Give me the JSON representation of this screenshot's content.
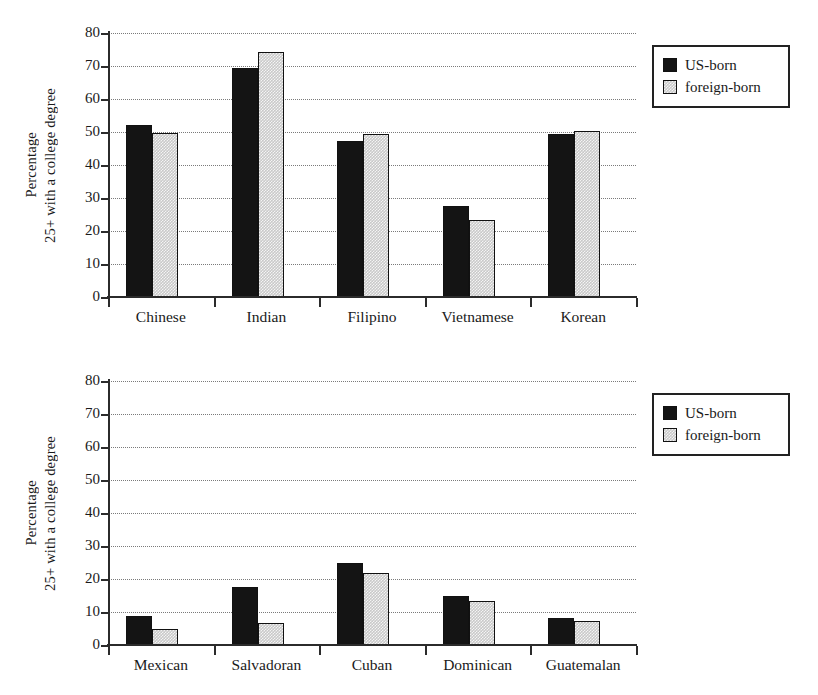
{
  "chart_data": [
    {
      "type": "bar",
      "id": "asian-origin-groups",
      "title": "",
      "xlabel": "",
      "ylabel": "Percentage 25+ with a college degree",
      "ylabel_lines": [
        "Percentage",
        "25+ with a college degree"
      ],
      "ylim": [
        0,
        80
      ],
      "yticks": [
        0,
        10,
        20,
        30,
        40,
        50,
        60,
        70,
        80
      ],
      "grid": true,
      "grid_style": "dotted-horizontal",
      "legend_position": "right",
      "categories": [
        "Chinese",
        "Indian",
        "Filipino",
        "Vietnamese",
        "Korean"
      ],
      "series": [
        {
          "name": "US-born",
          "color": "#141414",
          "values": [
            52.0,
            69.5,
            47.3,
            27.5,
            49.5
          ]
        },
        {
          "name": "foreign-born",
          "color": "#c9c9c9",
          "values": [
            49.8,
            74.2,
            49.5,
            23.4,
            50.4
          ]
        }
      ]
    },
    {
      "type": "bar",
      "id": "hispanic-origin-groups",
      "title": "",
      "xlabel": "",
      "ylabel": "Percentage 25+ with a college degree",
      "ylabel_lines": [
        "Percentage",
        "25+ with a college degree"
      ],
      "ylim": [
        0,
        80
      ],
      "yticks": [
        0,
        10,
        20,
        30,
        40,
        50,
        60,
        70,
        80
      ],
      "grid": true,
      "grid_style": "dotted-horizontal",
      "legend_position": "right",
      "categories": [
        "Mexican",
        "Salvadoran",
        "Cuban",
        "Dominican",
        "Guatemalan"
      ],
      "series": [
        {
          "name": "US-born",
          "color": "#141414",
          "values": [
            8.8,
            17.5,
            25.0,
            14.8,
            8.2
          ]
        },
        {
          "name": "foreign-born",
          "color": "#c9c9c9",
          "values": [
            4.8,
            6.7,
            21.7,
            13.4,
            7.2
          ]
        }
      ]
    }
  ],
  "panels": [
    {
      "name": "top-panel",
      "yticks": [
        "80",
        "70",
        "60",
        "50",
        "40",
        "30",
        "20",
        "10",
        "0"
      ],
      "axis_title_lines": [
        "Percentage",
        "25+ with a college degree"
      ],
      "categories": [
        "Chinese",
        "Indian",
        "Filipino",
        "Vietnamese",
        "Korean"
      ],
      "legend": [
        {
          "label": "US-born",
          "swatch": "us"
        },
        {
          "label": "foreign-born",
          "swatch": "foreign"
        }
      ]
    },
    {
      "name": "bottom-panel",
      "yticks": [
        "80",
        "70",
        "60",
        "50",
        "40",
        "30",
        "20",
        "10",
        "0"
      ],
      "axis_title_lines": [
        "Percentage",
        "25+ with a college degree"
      ],
      "categories": [
        "Mexican",
        "Salvadoran",
        "Cuban",
        "Dominican",
        "Guatemalan"
      ],
      "legend": [
        {
          "label": "US-born",
          "swatch": "us"
        },
        {
          "label": "foreign-born",
          "swatch": "foreign"
        }
      ]
    }
  ]
}
